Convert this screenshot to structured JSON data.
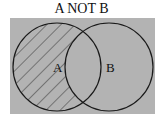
{
  "title": "A NOT B",
  "sets": [
    {
      "label": "A",
      "shaded": true
    },
    {
      "label": "B",
      "shaded": false
    }
  ],
  "colors": {
    "background": "#b3b3b3",
    "stroke": "#1a1a1a",
    "hatch": "#333333"
  }
}
